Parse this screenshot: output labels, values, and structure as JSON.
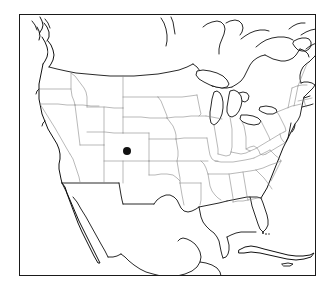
{
  "figure": {
    "type": "map",
    "title": "",
    "caption": "",
    "background_color": "#ffffff",
    "frame": {
      "visible": true,
      "color": "#1a1a1a",
      "line_width_px": 1.5,
      "left_px": 19,
      "top_px": 14,
      "width_px": 297,
      "height_px": 262
    }
  },
  "map": {
    "region": "Contiguous United States",
    "projection": "conic",
    "coastline_color": "#111111",
    "state_border_color": "#8a8a8a",
    "national_border_color": "#111111",
    "land_fill": "#ffffff",
    "water_fill": "#ffffff",
    "features_shown": [
      "coastline",
      "state-boundaries",
      "us-canada-border",
      "us-mexico-border",
      "great-lakes",
      "baja-california",
      "cuba",
      "florida-keys"
    ]
  },
  "markers": [
    {
      "name": "point-marker",
      "label": "",
      "shape": "circle",
      "color": "#111111",
      "radius_px": 4,
      "x_px": 126,
      "y_px": 150,
      "approx_location": "south-central Colorado"
    }
  ],
  "chart_data": {
    "type": "scatter",
    "title": "",
    "xlabel": "",
    "ylabel": "",
    "basemap": "Contiguous United States outline",
    "points": [
      {
        "label": "",
        "x_px": 126,
        "y_px": 150,
        "region": "Colorado",
        "color": "#111111",
        "size_px": 8
      }
    ],
    "legend": [],
    "grid": false,
    "annotations": []
  }
}
